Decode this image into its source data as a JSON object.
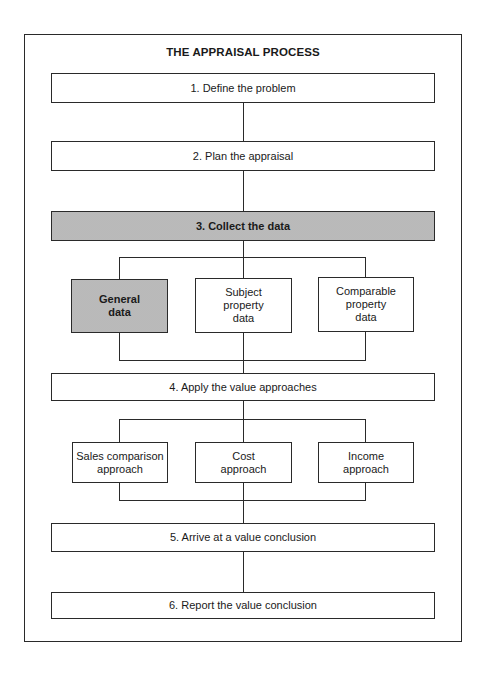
{
  "diagram": {
    "title": "THE APPRAISAL PROCESS",
    "steps": [
      {
        "label": "1. Define the problem",
        "shaded": false
      },
      {
        "label": "2.  Plan the appraisal",
        "shaded": false
      },
      {
        "label": "3.  Collect the data",
        "shaded": true
      },
      {
        "label": "4.  Apply the value approaches",
        "shaded": false
      },
      {
        "label": "5.  Arrive at a value conclusion",
        "shaded": false
      },
      {
        "label": "6.  Report the value conclusion",
        "shaded": false
      }
    ],
    "data_branches": [
      {
        "line1": "General",
        "line2": "data",
        "line3": "",
        "shaded": true
      },
      {
        "line1": "Subject",
        "line2": "property",
        "line3": "data",
        "shaded": false
      },
      {
        "line1": "Comparable",
        "line2": "property",
        "line3": "data",
        "shaded": false
      }
    ],
    "approach_branches": [
      {
        "line1": "Sales comparison",
        "line2": "approach",
        "shaded": false
      },
      {
        "line1": "Cost",
        "line2": "approach",
        "shaded": false
      },
      {
        "line1": "Income",
        "line2": "approach",
        "shaded": false
      }
    ],
    "colors": {
      "line": "#2a2a2a",
      "shade": "#d4d4d4",
      "background": "#ffffff"
    }
  }
}
